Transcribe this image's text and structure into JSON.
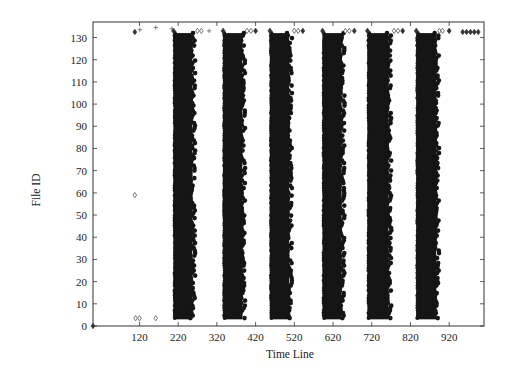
{
  "chart_data": {
    "type": "scatter",
    "title": "",
    "xlabel": "Time Line",
    "ylabel": "File ID",
    "xlim": [
      0,
      1010
    ],
    "ylim": [
      0,
      137
    ],
    "grid": false,
    "legend": null,
    "x_ticks": [
      120,
      220,
      320,
      420,
      520,
      620,
      720,
      820,
      920
    ],
    "x_tick_labels": [
      "120",
      "220",
      "320",
      "420",
      "520",
      "620",
      "720",
      "820",
      "920"
    ],
    "y_ticks": [
      0,
      10,
      20,
      30,
      40,
      50,
      60,
      70,
      80,
      90,
      100,
      110,
      120,
      130
    ],
    "y_tick_labels": [
      "0",
      "10",
      "20",
      "30",
      "40",
      "50",
      "60",
      "70",
      "80",
      "90",
      "100",
      "110",
      "120",
      "130"
    ],
    "dense_bands": [
      {
        "x_start": 208,
        "x_end": 264,
        "y_start": 3,
        "y_end": 132
      },
      {
        "x_start": 336,
        "x_end": 393,
        "y_start": 3,
        "y_end": 132
      },
      {
        "x_start": 457,
        "x_end": 514,
        "y_start": 3,
        "y_end": 132
      },
      {
        "x_start": 593,
        "x_end": 650,
        "y_start": 3,
        "y_end": 132
      },
      {
        "x_start": 709,
        "x_end": 771,
        "y_start": 3,
        "y_end": 132
      },
      {
        "x_start": 835,
        "x_end": 894,
        "y_start": 3,
        "y_end": 132
      }
    ],
    "series": [
      {
        "name": "open-diamond",
        "marker": "open-diamond",
        "points": [
          [
            110,
            3.5
          ],
          [
            120,
            3.5
          ],
          [
            162,
            3.5
          ],
          [
            108,
            59
          ],
          [
            270,
            133
          ],
          [
            280,
            133
          ],
          [
            398,
            133
          ],
          [
            408,
            133
          ],
          [
            520,
            133
          ],
          [
            530,
            133
          ],
          [
            652,
            133
          ],
          [
            662,
            133
          ],
          [
            778,
            133
          ],
          [
            788,
            133
          ],
          [
            895,
            133
          ],
          [
            903,
            133
          ]
        ]
      },
      {
        "name": "filled-diamond",
        "marker": "filled-diamond",
        "points": [
          [
            108,
            132.5
          ],
          [
            208,
            133
          ],
          [
            336,
            133
          ],
          [
            420,
            133
          ],
          [
            457,
            133
          ],
          [
            542,
            133
          ],
          [
            593,
            133
          ],
          [
            675,
            133
          ],
          [
            709,
            133
          ],
          [
            800,
            133
          ],
          [
            835,
            133
          ],
          [
            920,
            133
          ],
          [
            955,
            132.5
          ],
          [
            965,
            132.5
          ],
          [
            975,
            132.5
          ],
          [
            985,
            132.5
          ],
          [
            995,
            132.5
          ]
        ]
      },
      {
        "name": "plus",
        "marker": "plus",
        "points": [
          [
            121,
            133.5
          ],
          [
            162,
            134.5
          ],
          [
            204,
            134
          ],
          [
            300,
            133
          ]
        ]
      },
      {
        "name": "origin",
        "marker": "filled-diamond",
        "points": [
          [
            0,
            0
          ]
        ]
      }
    ]
  }
}
